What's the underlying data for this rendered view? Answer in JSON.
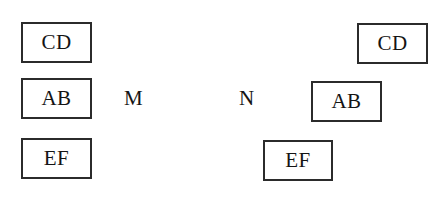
{
  "diagram": {
    "background_color": "#ffffff",
    "border_color": "#2b2b2b",
    "text_color": "#141414",
    "width": 438,
    "height": 204,
    "left_group": {
      "name": "left-aligned-stack",
      "boxes": [
        {
          "label": "CD",
          "x": 21,
          "y": 22,
          "w": 71,
          "h": 41
        },
        {
          "label": "AB",
          "x": 21,
          "y": 78,
          "w": 71,
          "h": 41
        },
        {
          "label": "EF",
          "x": 21,
          "y": 138,
          "w": 71,
          "h": 41
        }
      ]
    },
    "right_group": {
      "name": "right-staggered-stack",
      "boxes": [
        {
          "label": "CD",
          "x": 357,
          "y": 23,
          "w": 71,
          "h": 41
        },
        {
          "label": "AB",
          "x": 311,
          "y": 81,
          "w": 71,
          "h": 41
        },
        {
          "label": "EF",
          "x": 263,
          "y": 140,
          "w": 70,
          "h": 41
        }
      ]
    },
    "markers": [
      {
        "label": "M",
        "x": 124,
        "y": 88
      },
      {
        "label": "N",
        "x": 239,
        "y": 88
      }
    ]
  }
}
